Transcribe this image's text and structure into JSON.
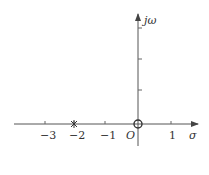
{
  "diagram": {
    "type": "pole-zero plot",
    "axes": {
      "horizontal_label": "σ",
      "vertical_label": "jω",
      "origin_label": "O"
    },
    "x_ticks": [
      {
        "value": -3,
        "label": "−3"
      },
      {
        "value": -2,
        "label": "−2"
      },
      {
        "value": -1,
        "label": "−1"
      },
      {
        "value": 1,
        "label": "1"
      }
    ],
    "poles": [
      {
        "re": -2,
        "im": 0,
        "marker": "×"
      }
    ],
    "zeros": [
      {
        "re": 0,
        "im": 0,
        "marker": "○"
      }
    ],
    "colors": {
      "axis": "#555555",
      "text": "#333333"
    }
  }
}
